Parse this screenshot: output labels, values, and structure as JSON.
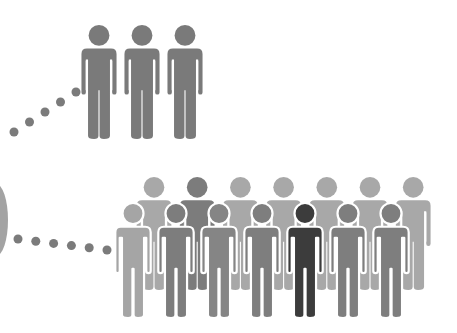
{
  "colors": {
    "top_group": "#7a7a7a",
    "dots": "#7b7b7b",
    "left_edge": "#a3a3a3",
    "outline": "#ffffff"
  },
  "groups": {
    "top_group": {
      "count": 3,
      "icon": "person-icon"
    },
    "back_row": {
      "count": 7,
      "icon": "person-icon",
      "figure_colors": [
        "#a8a8a8",
        "#7c7c7c",
        "#a8a8a8",
        "#a8a8a8",
        "#a8a8a8",
        "#a8a8a8",
        "#a8a8a8"
      ]
    },
    "front_row": {
      "count": 7,
      "icon": "person-icon",
      "figure_colors": [
        "#a5a5a5",
        "#7d7d7d",
        "#858585",
        "#7e7e7e",
        "#3c3c3c",
        "#7e7e7e",
        "#7e7e7e"
      ]
    }
  },
  "connectors": {
    "upper_dots": 5,
    "lower_dots": 6
  }
}
